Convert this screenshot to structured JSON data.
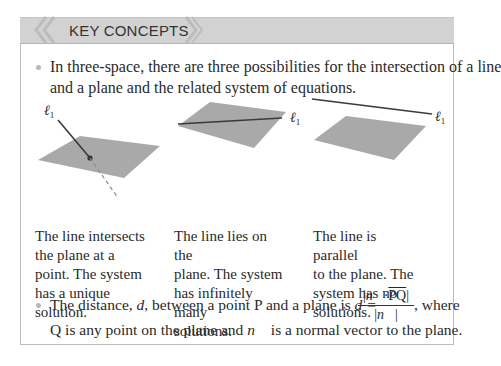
{
  "header": {
    "title": "KEY CONCEPTS",
    "band_color": "#d2d2d2"
  },
  "bullets": [
    {
      "line1": "In three-space, there are three possibilities for the intersection of a line",
      "line2": "and a plane and the related system of equations."
    },
    {
      "prefix": "The distance, ",
      "d": "d",
      "middle": ", between a point P and a plane is ",
      "eq": "d =",
      "numerator": "|n⃗ · PQ|",
      "numerator_n": "n⃗",
      "numerator_pq": "PQ",
      "denominator": "|n⃗|",
      "suffix": ", where",
      "line2_a": "Q is any point on the plane and ",
      "line2_n": "n⃗",
      "line2_b": " is a normal vector to the plane."
    }
  ],
  "figures": [
    {
      "label": "ℓ",
      "label_sub": "1",
      "caption": [
        "The line intersects",
        "the plane at a",
        "point. The system",
        "has a unique",
        "solution."
      ]
    },
    {
      "label": "ℓ",
      "label_sub": "1",
      "caption": [
        "The line lies on the",
        "plane. The system",
        "has infinitely many",
        "solutions."
      ]
    },
    {
      "label": "ℓ",
      "label_sub": "1",
      "caption": [
        "The line is parallel",
        "to the plane. The",
        "system has no",
        "solutions."
      ]
    }
  ],
  "colors": {
    "plane": "#a9a9a9",
    "line": "#3a3a3a",
    "border": "#bdbdbd"
  }
}
